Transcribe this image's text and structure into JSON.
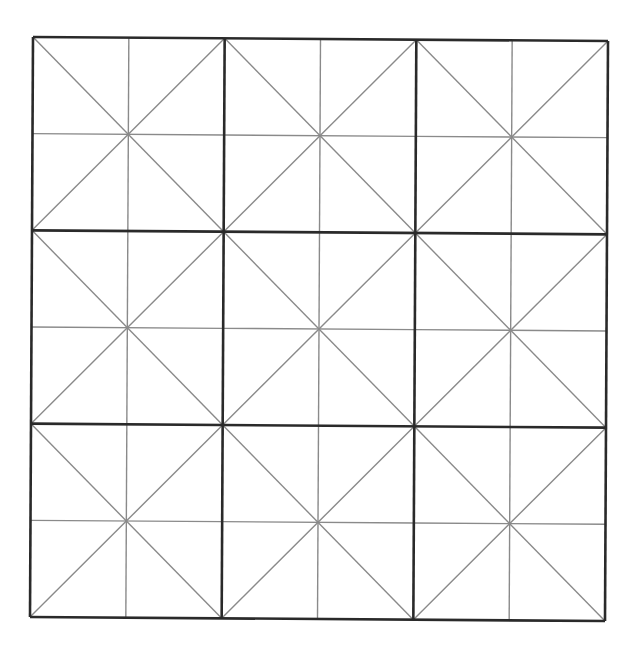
{
  "diagram": {
    "type": "practice-grid",
    "rows": 3,
    "cols": 3,
    "cell_subdivision": [
      "vertical-midline",
      "horizontal-midline",
      "diagonal-tl-br",
      "diagonal-tr-bl"
    ],
    "colors": {
      "background": "#ffffff",
      "major_line": "#2a2a2a",
      "minor_line": "#8a8a8a"
    }
  }
}
